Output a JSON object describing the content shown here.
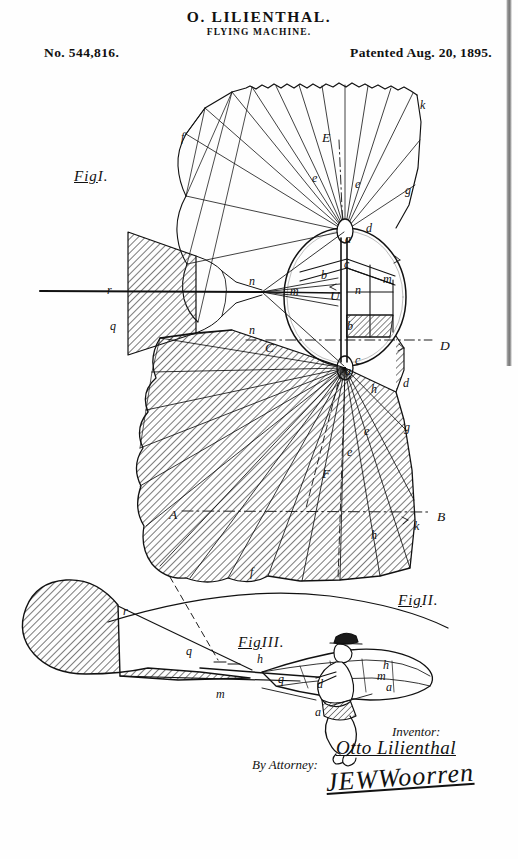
{
  "header": {
    "inventor_name": "O. LILIENTHAL.",
    "invention_title": "FLYING MACHINE.",
    "patent_number": "No. 544,816.",
    "patent_date": "Patented Aug. 20, 1895."
  },
  "figures": {
    "fig1": {
      "label": "Fig",
      "numeral": "I."
    },
    "fig2": {
      "label": "Fig",
      "numeral": "II."
    },
    "fig3": {
      "label": "Fig",
      "numeral": "III."
    }
  },
  "reference_letters": {
    "fig1": [
      {
        "id": "f-upper",
        "text": "f",
        "x": 181,
        "y": 131
      },
      {
        "id": "E-axis",
        "text": "E",
        "x": 322,
        "y": 131
      },
      {
        "id": "e-left",
        "text": "e",
        "x": 312,
        "y": 172
      },
      {
        "id": "e-right",
        "text": "e",
        "x": 355,
        "y": 178
      },
      {
        "id": "g-upper",
        "text": "g",
        "x": 405,
        "y": 184
      },
      {
        "id": "k-upper",
        "text": "k",
        "x": 420,
        "y": 99
      },
      {
        "id": "d-upper",
        "text": "d",
        "x": 366,
        "y": 222
      },
      {
        "id": "a-hub-upper",
        "text": "a",
        "x": 345,
        "y": 233
      },
      {
        "id": "c-upper",
        "text": "c",
        "x": 344,
        "y": 258
      },
      {
        "id": "b-upper",
        "text": "b",
        "x": 321,
        "y": 269
      },
      {
        "id": "m-right",
        "text": "m",
        "x": 383,
        "y": 273
      },
      {
        "id": "n-inner",
        "text": "n",
        "x": 355,
        "y": 284
      },
      {
        "id": "U-inner",
        "text": "U",
        "x": 330,
        "y": 289
      },
      {
        "id": "n-left",
        "text": "n",
        "x": 249,
        "y": 275
      },
      {
        "id": "m-left",
        "text": "m",
        "x": 290,
        "y": 285
      },
      {
        "id": "r-axis",
        "text": "r",
        "x": 107,
        "y": 284
      },
      {
        "id": "q-axis",
        "text": "q",
        "x": 110,
        "y": 320
      },
      {
        "id": "n-lower",
        "text": "n",
        "x": 249,
        "y": 324
      },
      {
        "id": "b-lower",
        "text": "b",
        "x": 347,
        "y": 320
      },
      {
        "id": "D-axis",
        "text": "D",
        "x": 440,
        "y": 339
      },
      {
        "id": "C-axis",
        "text": "C",
        "x": 265,
        "y": 341
      },
      {
        "id": "c-lower",
        "text": "c",
        "x": 355,
        "y": 354
      },
      {
        "id": "a-hub-lower",
        "text": "a",
        "x": 345,
        "y": 365
      },
      {
        "id": "d-lower",
        "text": "d",
        "x": 403,
        "y": 377
      },
      {
        "id": "h-lower",
        "text": "h",
        "x": 371,
        "y": 383
      },
      {
        "id": "g-lower",
        "text": "g",
        "x": 404,
        "y": 421
      },
      {
        "id": "e-lower-a",
        "text": "e",
        "x": 364,
        "y": 425
      },
      {
        "id": "e-lower-b",
        "text": "e",
        "x": 347,
        "y": 446
      },
      {
        "id": "F-lower",
        "text": "F",
        "x": 322,
        "y": 467
      },
      {
        "id": "A-axis",
        "text": "A",
        "x": 169,
        "y": 508
      },
      {
        "id": "B-axis",
        "text": "B",
        "x": 437,
        "y": 510
      },
      {
        "id": "k-lower",
        "text": "k",
        "x": 414,
        "y": 520
      },
      {
        "id": "h-bottom",
        "text": "h",
        "x": 371,
        "y": 529
      },
      {
        "id": "f-bottom",
        "text": "f",
        "x": 250,
        "y": 566
      }
    ],
    "fig3": [
      {
        "id": "r-fig3",
        "text": "r",
        "x": 123,
        "y": 605
      },
      {
        "id": "q-fig3",
        "text": "q",
        "x": 186,
        "y": 645
      },
      {
        "id": "m-fig3",
        "text": "m",
        "x": 216,
        "y": 688
      },
      {
        "id": "h-fig3",
        "text": "h",
        "x": 257,
        "y": 653
      },
      {
        "id": "q-fig3b",
        "text": "q",
        "x": 278,
        "y": 673
      },
      {
        "id": "a-man-front",
        "text": "a",
        "x": 315,
        "y": 706
      },
      {
        "id": "d-man",
        "text": "d",
        "x": 317,
        "y": 678
      },
      {
        "id": "h-man",
        "text": "h",
        "x": 383,
        "y": 659
      },
      {
        "id": "m-man",
        "text": "m",
        "x": 377,
        "y": 670
      },
      {
        "id": "a-man-rear",
        "text": "a",
        "x": 386,
        "y": 681
      }
    ]
  },
  "signature_block": {
    "inventor_label": "Inventor:",
    "inventor_signature": "Otto Lilienthal",
    "attorney_label": "By Attorney:",
    "attorney_signature": "JEWWoorren"
  },
  "colors": {
    "ink": "#111111",
    "paper": "#fefefe",
    "hatch": "#3a3a3a"
  }
}
